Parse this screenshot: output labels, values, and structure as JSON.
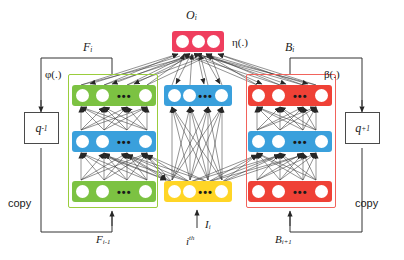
{
  "diagram": {
    "title_top": "O",
    "title_top_sub": "i",
    "labels": {
      "output_symbol": "O",
      "output_sub": "i",
      "eta": "η(.)",
      "phi": "φ(.)",
      "beta": "β(.)",
      "F_i": "F",
      "F_i_sub": "i",
      "B_i": "B",
      "B_i_sub": "i",
      "F_prev": "F",
      "F_prev_sub": "i-1",
      "B_next": "B",
      "B_next_sub": "i+1",
      "input_symbol": "I",
      "input_sub": "i",
      "ith": "i",
      "ith_sup": "th",
      "q_minus": "q",
      "q_minus_sup": "-1",
      "q_plus": "q",
      "q_plus_sup": "+1",
      "copy_left": "copy",
      "copy_right": "copy"
    },
    "colors": {
      "green": "#7cc242",
      "green_border": "#9acd3c",
      "blue": "#3aa0dc",
      "red": "#ef4136",
      "red_border": "#f1635c",
      "pink": "#ef3e5e",
      "yellow": "#ffd526",
      "node": "#ffffff",
      "wire": "#3a3a3a",
      "line": "#333333"
    },
    "ellipsis": "•••",
    "groups": [
      {
        "name": "forward-group",
        "outline": "green",
        "rows": [
          {
            "name": "forward-top-row",
            "color": "green",
            "nodes": 4,
            "ellipsis": true
          },
          {
            "name": "forward-mid-row",
            "color": "blue",
            "nodes": 4,
            "ellipsis": true
          },
          {
            "name": "forward-bottom-row",
            "color": "green",
            "nodes": 4,
            "ellipsis": true
          }
        ]
      },
      {
        "name": "center-group",
        "outline": "none",
        "rows": [
          {
            "name": "output-row",
            "color": "pink",
            "nodes": 3,
            "ellipsis": false
          },
          {
            "name": "center-hidden-row",
            "color": "blue",
            "nodes": 4,
            "ellipsis": true
          },
          {
            "name": "input-row",
            "color": "yellow",
            "nodes": 4,
            "ellipsis": true
          }
        ]
      },
      {
        "name": "backward-group",
        "outline": "red",
        "rows": [
          {
            "name": "backward-top-row",
            "color": "red",
            "nodes": 4,
            "ellipsis": true
          },
          {
            "name": "backward-mid-row",
            "color": "blue",
            "nodes": 4,
            "ellipsis": true
          },
          {
            "name": "backward-bottom-row",
            "color": "red",
            "nodes": 4,
            "ellipsis": true
          }
        ]
      }
    ]
  }
}
